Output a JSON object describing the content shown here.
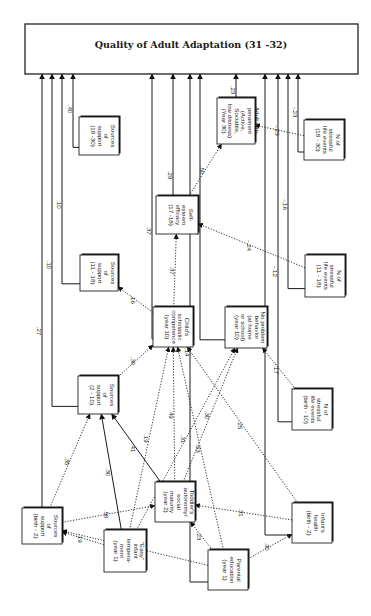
{
  "diagram": {
    "title": "Quality of Adult Adaptation (31 -32)",
    "nodes": [
      {
        "id": "sup_b2",
        "lines": [
          "Sources",
          "of",
          "support",
          "(birth - 2)"
        ]
      },
      {
        "id": "sup_2_10",
        "lines": [
          "Sources",
          "of",
          "support",
          "(2 - 10)"
        ]
      },
      {
        "id": "sup_11_18",
        "lines": [
          "Sources",
          "of",
          "support",
          "(11 - 18)"
        ]
      },
      {
        "id": "sup_18_30",
        "lines": [
          "Sources",
          "of",
          "support",
          "(18 -30)"
        ]
      },
      {
        "id": "easy",
        "lines": [
          "\"Easy\"",
          "infant",
          "tempera-",
          "ment",
          "(year 1)"
        ]
      },
      {
        "id": "toddler",
        "lines": [
          "Toddler's",
          "autonomy/",
          "social",
          "maturity",
          "(year 2)"
        ]
      },
      {
        "id": "parent_ed",
        "lines": [
          "Parental",
          "education",
          "(year 1)"
        ]
      },
      {
        "id": "child_sch",
        "lines": [
          "Child's",
          "scholastic",
          "competence",
          "(year 10)"
        ]
      },
      {
        "id": "noprob",
        "lines": [
          "No problem",
          "behavior",
          "(at home",
          "or school)",
          "(year 10)"
        ]
      },
      {
        "id": "self_est",
        "lines": [
          "Self-",
          "esteem",
          "efficacy",
          "(17 -18)"
        ]
      },
      {
        "id": "adult_temp",
        "lines": [
          "Adult tem-",
          "perament",
          "(Active,",
          "Sociable,",
          "low distress)",
          "(Year 30)"
        ]
      },
      {
        "id": "infant_health",
        "lines": [
          "Infant's",
          "health",
          "(birth - 2)"
        ]
      },
      {
        "id": "stress_b10",
        "lines": [
          "N of",
          "stressful",
          "life events",
          "(birth - 10)"
        ]
      },
      {
        "id": "stress_11_18",
        "lines": [
          "N of",
          "stressful",
          "life events",
          "(11 - 18)"
        ]
      },
      {
        "id": "stress_18_30",
        "lines": [
          "N of",
          "stressful",
          "life events",
          "(18 - 30)"
        ]
      }
    ],
    "paths": [
      {
        "from": "sup_b2",
        "to": "outcome",
        "coef": ".27",
        "style": "solid"
      },
      {
        "from": "sup_2_10",
        "to": "outcome",
        "coef": ".10",
        "style": "solid"
      },
      {
        "from": "sup_11_18",
        "to": "outcome",
        "coef": ".10",
        "style": "solid"
      },
      {
        "from": "sup_18_30",
        "to": "outcome",
        "coef": ".40",
        "style": "solid"
      },
      {
        "from": "child_sch",
        "to": "outcome",
        "coef": ".37",
        "style": "solid"
      },
      {
        "from": "self_est",
        "to": "outcome",
        "coef": ".29",
        "style": "solid"
      },
      {
        "from": "noprob",
        "to": "outcome",
        "coef": ".29",
        "style": "solid"
      },
      {
        "from": "adult_temp",
        "to": "outcome",
        "coef": ".23",
        "style": "solid"
      },
      {
        "from": "stress_b10",
        "to": "outcome",
        "coef": "-.12",
        "style": "solid"
      },
      {
        "from": "stress_11_18",
        "to": "outcome",
        "coef": "-.16",
        "style": "solid"
      },
      {
        "from": "stress_18_30",
        "to": "outcome",
        "coef": "-.23",
        "style": "solid"
      },
      {
        "from": "parent_ed",
        "to": "outcome",
        "coef": ".14",
        "style": "solid"
      },
      {
        "from": "infant_health",
        "to": "outcome",
        "coef": ".19",
        "style": "solid"
      },
      {
        "from": "self_est",
        "to": "adult_temp",
        "coef": ".50",
        "style": "dotted"
      },
      {
        "from": "stress_18_30",
        "to": "adult_temp",
        "coef": "-.23",
        "style": "dotted"
      },
      {
        "from": "child_sch",
        "to": "self_est",
        "coef": ".37",
        "style": "dotted"
      },
      {
        "from": "stress_11_18",
        "to": "self_est",
        "coef": "-.24",
        "style": "dotted"
      },
      {
        "from": "child_sch",
        "to": "sup_11_18",
        "coef": ".16",
        "style": "dotted"
      },
      {
        "from": "stress_b10",
        "to": "noprob",
        "coef": "-.17",
        "style": "dotted"
      },
      {
        "from": "sup_2_10",
        "to": "child_sch",
        "coef": ".30",
        "style": "dotted"
      },
      {
        "from": "sup_b2",
        "to": "sup_2_10",
        "coef": ".35",
        "style": "dotted"
      },
      {
        "from": "toddler",
        "to": "sup_2_10",
        "coef": ".41",
        "style": "solid"
      },
      {
        "from": "easy",
        "to": "sup_2_10",
        "coef": ".30",
        "style": "solid"
      },
      {
        "from": "sup_b2",
        "to": "toddler",
        "coef": ".58",
        "style": "dotted"
      },
      {
        "from": "easy",
        "to": "sup_b2",
        "coef": ".19",
        "style": "dotted"
      },
      {
        "from": "easy",
        "to": "child_sch",
        "coef": ".19",
        "style": "dotted"
      },
      {
        "from": "toddler",
        "to": "child_sch",
        "coef": ".49",
        "style": "dotted"
      },
      {
        "from": "toddler",
        "to": "noprob",
        "coef": ".30",
        "style": "dotted"
      },
      {
        "from": "easy",
        "to": "noprob",
        "coef": ".31",
        "style": "dotted"
      },
      {
        "from": "parent_ed",
        "to": "child_sch",
        "coef": ".53",
        "style": "dotted"
      },
      {
        "from": "parent_ed",
        "to": "toddler",
        "coef": ".23",
        "style": "dotted"
      },
      {
        "from": "parent_ed",
        "to": "infant_health",
        "coef": ".30",
        "style": "dotted"
      },
      {
        "from": "infant_health",
        "to": "toddler",
        "coef": ".31",
        "style": "dotted"
      },
      {
        "from": "infant_health",
        "to": "child_sch",
        "coef": ".25",
        "style": "dotted"
      },
      {
        "from": "parent_ed",
        "to": "sup_b2",
        "coef": ".32",
        "style": "dotted"
      }
    ]
  }
}
